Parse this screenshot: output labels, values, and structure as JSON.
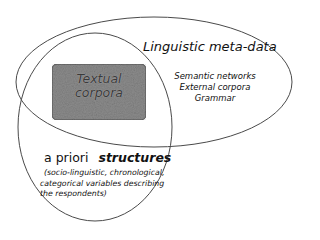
{
  "diagram": {
    "type": "venn-like overlapping ellipses",
    "shapes": {
      "meta_ellipse": {
        "cx": 154,
        "cy": 82,
        "rx": 138,
        "ry": 65,
        "stroke": "#4a4a4a"
      },
      "apriori_ellipse": {
        "cx": 95,
        "cy": 127,
        "rx": 77,
        "ry": 94,
        "stroke": "#4a4a4a"
      },
      "corpora_box": {
        "x": 52,
        "y": 64,
        "width": 94,
        "height": 56,
        "fill": "#8f8f8f",
        "stroke": "#555555"
      }
    },
    "textual_corpora": {
      "line1": "Textual",
      "line2": "corpora"
    },
    "linguistic_meta_data": {
      "title": "Linguistic meta-data",
      "items": [
        "Semantic networks",
        "External corpora",
        "Grammar"
      ]
    },
    "a_priori_structures": {
      "title_plain": "a priori",
      "title_emphasis": "structures",
      "description_lines": [
        "(socio-linguistic, chronological,",
        "categorical variables describing",
        "the respondents)"
      ]
    }
  }
}
